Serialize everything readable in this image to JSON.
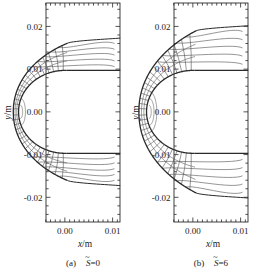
{
  "figure": {
    "background": "#ffffff",
    "line_color": "#2a2a2a",
    "thin_line_color": "#555555",
    "panels": [
      {
        "id": "panel-a",
        "caption_prefix": "(a)",
        "caption_symbol": "S",
        "caption_overbar": "~",
        "caption_value": "=0",
        "caption_full": "(a) S̃=0",
        "xlabel": "x/m",
        "ylabel": "y/m",
        "xticks": [
          "0.00",
          "0.01"
        ],
        "xtick_values": [
          0.0,
          0.01
        ],
        "yticks": [
          "0.02",
          "0.01",
          "0.00",
          "-0.01",
          "-0.02"
        ],
        "ytick_values": [
          0.02,
          0.01,
          0.0,
          -0.01,
          -0.02
        ]
      },
      {
        "id": "panel-b",
        "caption_prefix": "(b)",
        "caption_symbol": "S",
        "caption_overbar": "~",
        "caption_value": "=6",
        "caption_full": "(b) S̃=6",
        "xlabel": "x/m",
        "ylabel": "y/m",
        "xticks": [
          "0.00",
          "0.01"
        ],
        "xtick_values": [
          0.0,
          0.01
        ],
        "yticks": [
          "0.02",
          "0.01",
          "0.00",
          "-0.01",
          "-0.02"
        ],
        "ytick_values": [
          0.02,
          0.01,
          0.0,
          -0.01,
          -0.02
        ]
      }
    ]
  },
  "chart_data": {
    "type": "line",
    "title": "",
    "subtitle": "",
    "xlabel": "x/m",
    "ylabel": "y/m",
    "xlim": [
      -0.004,
      0.0115
    ],
    "ylim": [
      -0.026,
      0.0255
    ],
    "grid": false,
    "legend": null,
    "panels": [
      {
        "name": "(a) S̃=0",
        "body_surface": {
          "shape": "circle-arc",
          "center_x": 0.0,
          "center_y": 0.0,
          "radius_m": 0.0097,
          "note": "body nose circle, right half open toward +x"
        },
        "shock_outline": {
          "shape": "detached-arc",
          "standoff_at_stagnation_m": 0.0011,
          "nose_x_m": -0.0108,
          "upper_end_x_m": 0.0104,
          "upper_end_y_m": 0.0172,
          "lower_end_x_m": 0.0104,
          "lower_end_y_m": -0.0172
        },
        "streamline_count": 26,
        "streamline_angles_deg": [
          -88,
          -82,
          -76,
          -70,
          -64,
          -58,
          -52,
          -46,
          -40,
          -34,
          -28,
          -22,
          -16,
          -10,
          -4,
          4,
          10,
          16,
          22,
          28,
          34,
          40,
          46,
          52,
          58,
          64,
          70,
          76,
          82,
          88
        ],
        "trailing_curves": 5
      },
      {
        "name": "(b) S̃=6",
        "body_surface": {
          "shape": "circle-arc",
          "center_x": 0.0,
          "center_y": 0.0,
          "radius_m": 0.0097,
          "note": "body nose circle, right half open toward +x"
        },
        "shock_outline": {
          "shape": "detached-arc",
          "standoff_at_stagnation_m": 0.0016,
          "nose_x_m": -0.0113,
          "upper_end_x_m": 0.0104,
          "upper_end_y_m": 0.0205,
          "lower_end_x_m": 0.0104,
          "lower_end_y_m": -0.0205
        },
        "streamline_count": 26,
        "streamline_angles_deg": [
          -88,
          -82,
          -76,
          -70,
          -64,
          -58,
          -52,
          -46,
          -40,
          -34,
          -28,
          -22,
          -16,
          -10,
          -4,
          4,
          10,
          16,
          22,
          28,
          34,
          40,
          46,
          52,
          58,
          64,
          70,
          76,
          82,
          88
        ],
        "trailing_curves": 5
      }
    ]
  }
}
